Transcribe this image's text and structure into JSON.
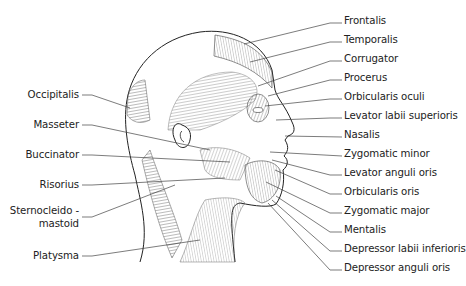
{
  "labels_right": [
    {
      "text": "Frontalis",
      "y": 20
    },
    {
      "text": "Temporalis",
      "y": 39
    },
    {
      "text": "Corrugator",
      "y": 58
    },
    {
      "text": "Procerus",
      "y": 77
    },
    {
      "text": "Orbicularis oculi",
      "y": 96
    },
    {
      "text": "Levator labii superioris",
      "y": 115
    },
    {
      "text": "Nasalis",
      "y": 134
    },
    {
      "text": "Zygomatic minor",
      "y": 153
    },
    {
      "text": "Levator anguli oris",
      "y": 172
    },
    {
      "text": "Orbicularis oris",
      "y": 191
    },
    {
      "text": "Zygomatic major",
      "y": 210
    },
    {
      "text": "Mentalis",
      "y": 229
    },
    {
      "text": "Depressor labii inferioris",
      "y": 248
    },
    {
      "text": "Depressor anguli oris",
      "y": 267
    }
  ],
  "labels_left": [
    {
      "text": "Occipitalis",
      "y": 95
    },
    {
      "text": "Masseter",
      "y": 125
    },
    {
      "text": "Buccinator",
      "y": 155
    },
    {
      "text": "Risorius",
      "y": 185
    },
    {
      "text": "Sternocleido -",
      "y": 211
    },
    {
      "text": "mastoid",
      "y": 224
    },
    {
      "text": "Platysma",
      "y": 256
    }
  ]
}
